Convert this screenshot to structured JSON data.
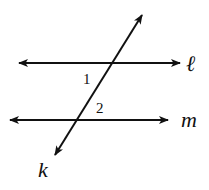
{
  "diagram": {
    "type": "parallel-lines-cut-by-transversal",
    "lines": {
      "l": {
        "label": "ℓ",
        "role": "parallel line"
      },
      "m": {
        "label": "m",
        "role": "parallel line"
      },
      "k": {
        "label": "k",
        "role": "transversal"
      }
    },
    "angles": [
      {
        "label": "1",
        "position": "below line ℓ, left of transversal k"
      },
      {
        "label": "2",
        "position": "above line m, right of transversal k"
      }
    ],
    "colors": {
      "stroke": "#111111",
      "background": "#ffffff"
    }
  }
}
